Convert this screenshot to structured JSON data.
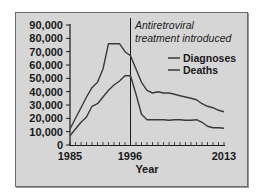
{
  "chart_data": {
    "type": "line",
    "title": "",
    "xlabel": "Year",
    "ylabel": "",
    "xlim": [
      1985,
      2013
    ],
    "ylim": [
      0,
      90000
    ],
    "x_tick_labels": [
      "1985",
      "1996",
      "2013"
    ],
    "y_tick_labels": [
      "0",
      "10,000",
      "20,000",
      "30,000",
      "40,000",
      "50,000",
      "60,000",
      "70,000",
      "80,000",
      "90,000"
    ],
    "grid": false,
    "legend_position": "upper right",
    "annotations": [
      {
        "text_line1": "Antiretroviral",
        "text_line2": "treatment introduced",
        "x": 1996,
        "type": "vertical-line"
      }
    ],
    "x": [
      1985,
      1986,
      1987,
      1988,
      1989,
      1990,
      1991,
      1992,
      1993,
      1994,
      1995,
      1996,
      1997,
      1998,
      1999,
      2000,
      2001,
      2002,
      2003,
      2004,
      2005,
      2006,
      2007,
      2008,
      2009,
      2010,
      2011,
      2012,
      2013
    ],
    "series": [
      {
        "name": "Diagnoses",
        "color": "#3a3a3a",
        "values": [
          12000,
          20000,
          28000,
          36000,
          43000,
          47000,
          57000,
          76000,
          76000,
          76000,
          70000,
          67000,
          57000,
          47000,
          41000,
          39000,
          40000,
          39000,
          39000,
          38000,
          37000,
          36000,
          35000,
          34000,
          31000,
          29000,
          28000,
          26000,
          25000
        ]
      },
      {
        "name": "Deaths",
        "color": "#3a3a3a",
        "values": [
          7000,
          12000,
          17000,
          21000,
          29000,
          31000,
          36000,
          41000,
          45000,
          48000,
          52000,
          52000,
          38000,
          23000,
          19000,
          19000,
          19000,
          19000,
          18500,
          19000,
          19000,
          18500,
          18500,
          19000,
          17000,
          14000,
          13000,
          13000,
          12500
        ]
      }
    ]
  },
  "legend": {
    "items": [
      {
        "label": "Diagnoses"
      },
      {
        "label": "Deaths"
      }
    ]
  },
  "annotation": {
    "line1": "Antiretroviral",
    "line2": "treatment introduced"
  },
  "axes": {
    "xlabel": "Year",
    "xticks": {
      "start": "1985",
      "mid": "1996",
      "end": "2013"
    },
    "yticks": [
      "90,000",
      "80,000",
      "70,000",
      "60,000",
      "50,000",
      "40,000",
      "30,000",
      "20,000",
      "10,000",
      "0"
    ]
  }
}
